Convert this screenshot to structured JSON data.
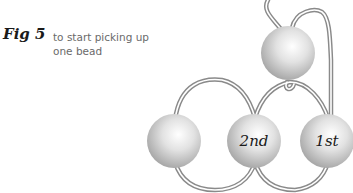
{
  "figure": {
    "label": "Fig 5",
    "caption_line1": "to start picking up",
    "caption_line2": "one bead"
  },
  "beads": [
    {
      "id": "top",
      "label": ""
    },
    {
      "id": "left",
      "label": ""
    },
    {
      "id": "second",
      "label": "2nd"
    },
    {
      "id": "first",
      "label": "1st"
    }
  ],
  "colors": {
    "bead_light": "#ffffff",
    "bead_dark": "#a9a9a9",
    "thread": "#8a8a8a",
    "label": "#1a1a1a",
    "caption": "#6a6a6a"
  }
}
